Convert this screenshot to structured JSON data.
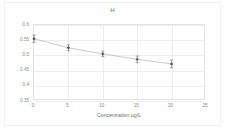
{
  "chart_data": {
    "type": "line",
    "title": "H",
    "xlabel": "Concentration µg/L",
    "ylabel": "",
    "x": [
      0,
      5,
      10,
      15,
      20
    ],
    "values": [
      0.555,
      0.525,
      0.505,
      0.487,
      0.472
    ],
    "errors": [
      0.012,
      0.01,
      0.009,
      0.011,
      0.013
    ],
    "series": [
      {
        "name": "H",
        "values": [
          0.555,
          0.525,
          0.505,
          0.487,
          0.472
        ]
      }
    ],
    "xlim": [
      0,
      25
    ],
    "ylim": [
      0.35,
      0.6
    ],
    "xticks": [
      0,
      5,
      10,
      15,
      20,
      25
    ],
    "xtick_labels": [
      "0",
      "5",
      "10",
      "15",
      "20",
      "25"
    ],
    "yticks": [
      0.35,
      0.4,
      0.45,
      0.5,
      0.55,
      0.6
    ],
    "ytick_labels": [
      "0.35",
      "0.4",
      "0.45",
      "0.5",
      "0.55",
      "0.6"
    ],
    "grid": true,
    "legend": "none",
    "marker": "diamond",
    "error_bars": true,
    "colors": {
      "line": "#a6a6a6",
      "marker": "#595959",
      "grid": "#ededed",
      "axis": "#e3e3e3",
      "text": "#8a8a8a",
      "background": "#ffffff"
    }
  }
}
